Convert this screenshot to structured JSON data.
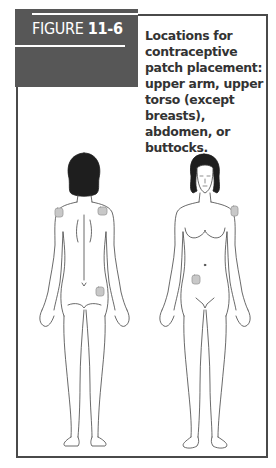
{
  "figure": {
    "label": "FIGURE",
    "number": "11-6",
    "caption": "Locations for contraceptive patch placement: upper arm, upper torso (except breasts), abdomen, or buttocks."
  },
  "illustration": {
    "views": [
      {
        "name": "back view",
        "patch_sites": [
          "left upper arm",
          "right upper back",
          "right buttock"
        ]
      },
      {
        "name": "front view",
        "patch_sites": [
          "left upper arm",
          "abdomen"
        ]
      }
    ],
    "colors": {
      "header": "#575757",
      "patch": "#c8c8c8",
      "line": "#444444",
      "hair": "#1e1e1e"
    }
  }
}
